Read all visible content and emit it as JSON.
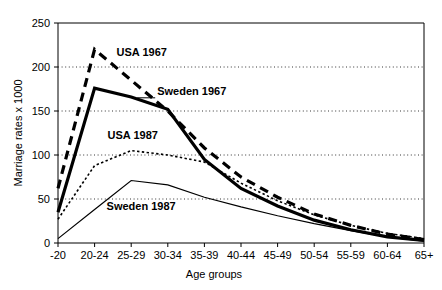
{
  "chart_data": {
    "type": "line",
    "title": "",
    "xlabel": "Age groups",
    "ylabel": "Marriage rates x 1000",
    "categories": [
      "-20",
      "20-24",
      "25-29",
      "30-34",
      "35-39",
      "40-44",
      "45-49",
      "50-54",
      "55-59",
      "60-64",
      "65+"
    ],
    "ylim": [
      0,
      250
    ],
    "yticks": [
      0,
      50,
      100,
      150,
      200,
      250
    ],
    "ytick_labels": [
      "0",
      "50",
      "100",
      "150",
      "200",
      "250"
    ],
    "grid": "horizontal-dotted",
    "legend": "inline-annotations",
    "series": [
      {
        "name": "USA 1967",
        "style": "thick-dashed",
        "color": "#000000",
        "values": [
          62,
          220,
          185,
          150,
          108,
          75,
          52,
          33,
          20,
          10,
          4
        ]
      },
      {
        "name": "Sweden 1967",
        "style": "thick-solid",
        "color": "#000000",
        "values": [
          35,
          176,
          166,
          152,
          95,
          62,
          42,
          26,
          15,
          7,
          3
        ]
      },
      {
        "name": "USA 1987",
        "style": "fine-dotted",
        "color": "#000000",
        "values": [
          27,
          88,
          105,
          100,
          92,
          68,
          48,
          32,
          20,
          11,
          5
        ]
      },
      {
        "name": "Sweden 1987",
        "style": "thin-solid",
        "color": "#000000",
        "values": [
          5,
          38,
          71,
          66,
          52,
          41,
          31,
          22,
          14,
          7,
          2
        ]
      }
    ],
    "annotations": [
      {
        "text": "USA 1967",
        "series": "USA 1967"
      },
      {
        "text": "Sweden 1967",
        "series": "Sweden 1967",
        "leader_line": true
      },
      {
        "text": "USA 1987",
        "series": "USA 1987"
      },
      {
        "text": "Sweden 1987",
        "series": "Sweden 1987"
      }
    ]
  }
}
